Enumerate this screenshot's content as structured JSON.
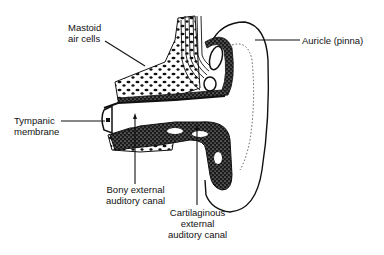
{
  "diagram": {
    "labels": [
      {
        "id": "mastoid",
        "lines": [
          "Mastoid",
          "air cells"
        ]
      },
      {
        "id": "auricle",
        "lines": [
          "Auricle (pinna)"
        ]
      },
      {
        "id": "tympanic",
        "lines": [
          "Tympanic",
          "membrane"
        ]
      },
      {
        "id": "bony",
        "lines": [
          "Bony external",
          "auditory canal"
        ]
      },
      {
        "id": "cartilaginous",
        "lines": [
          "Cartilaginous",
          "external",
          "auditory canal"
        ]
      }
    ],
    "colors": {
      "ink": "#111111",
      "background": "#ffffff"
    }
  }
}
